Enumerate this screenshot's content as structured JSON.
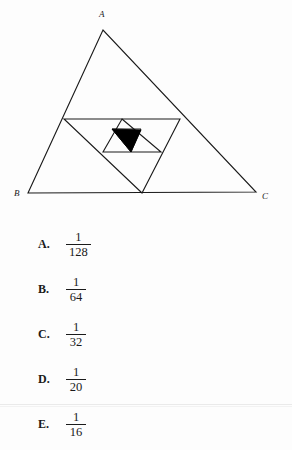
{
  "figure": {
    "vertex_labels": [
      {
        "name": "A",
        "text": "A",
        "x": 99,
        "y": 17
      },
      {
        "name": "B",
        "text": "B",
        "x": 14,
        "y": 196
      },
      {
        "name": "C",
        "text": "C",
        "x": 262,
        "y": 199
      }
    ],
    "stroke_color": "#1a1a1a",
    "fill_color": "#000000",
    "outer_triangle": {
      "A": [
        103,
        30
      ],
      "B": [
        28,
        193
      ],
      "C": [
        256,
        192
      ]
    },
    "midpoints_level1": {
      "AB_mid": [
        64,
        119
      ],
      "AC_mid": [
        180,
        119
      ],
      "BC_mid": [
        142,
        193
      ]
    },
    "midpoints_level2": {
      "p1": [
        103,
        152
      ],
      "p2": [
        161,
        152
      ],
      "p3": [
        122,
        119
      ]
    },
    "midpoints_level3": {
      "q1": [
        112,
        129
      ],
      "q2": [
        141,
        129
      ],
      "q3": [
        131,
        152
      ]
    },
    "shaded_triangle": {
      "points": [
        [
          112,
          129
        ],
        [
          141,
          130
        ],
        [
          131,
          152
        ]
      ],
      "label": "shaded-region"
    }
  },
  "choices": [
    {
      "letter": "A.",
      "numerator": "1",
      "denominator": "128"
    },
    {
      "letter": "B.",
      "numerator": "1",
      "denominator": "64"
    },
    {
      "letter": "C.",
      "numerator": "1",
      "denominator": "32"
    },
    {
      "letter": "D.",
      "numerator": "1",
      "denominator": "20"
    },
    {
      "letter": "E.",
      "numerator": "1",
      "denominator": "16"
    }
  ]
}
